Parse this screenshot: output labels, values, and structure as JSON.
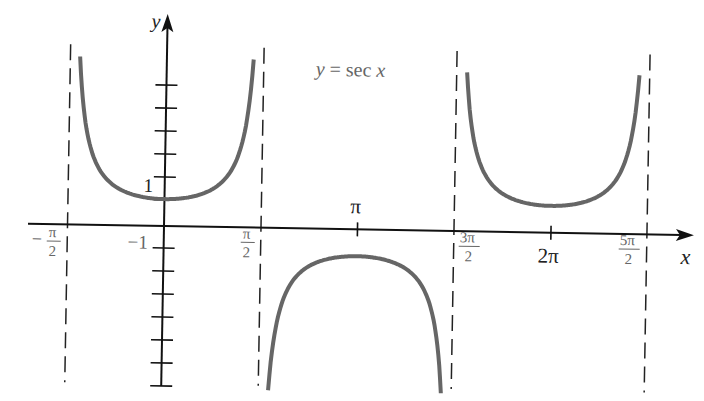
{
  "chart_data": {
    "type": "line",
    "title": "y = sec x",
    "function": "sec x",
    "xlabel": "x",
    "ylabel": "y",
    "x_tick_labels": [
      {
        "value": -1.5708,
        "label": "-π/2",
        "num": "π",
        "den": "2",
        "sign": "−"
      },
      {
        "value": 1.5708,
        "label": "π/2",
        "num": "π",
        "den": "2"
      },
      {
        "value": 3.1416,
        "label": "π"
      },
      {
        "value": 4.7124,
        "label": "3π/2",
        "num": "3π",
        "den": "2"
      },
      {
        "value": 6.2832,
        "label": "2π"
      },
      {
        "value": 7.854,
        "label": "5π/2",
        "num": "5π",
        "den": "2"
      }
    ],
    "y_tick_labels": [
      {
        "value": 1,
        "label": "1"
      },
      {
        "value": -1,
        "label": "−1"
      }
    ],
    "y_ticks_above": 6,
    "y_ticks_below": 7,
    "asymptotes": [
      "-π/2",
      "π/2",
      "3π/2",
      "5π/2"
    ],
    "branches": [
      {
        "x_range": [
          "-π/2",
          "π/2"
        ],
        "extremum": {
          "x": 0,
          "y": 1,
          "type": "min"
        }
      },
      {
        "x_range": [
          "π/2",
          "3π/2"
        ],
        "extremum": {
          "x": "π",
          "y": -1,
          "type": "max"
        }
      },
      {
        "x_range": [
          "3π/2",
          "5π/2"
        ],
        "extremum": {
          "x": "2π",
          "y": 1,
          "type": "min"
        }
      }
    ],
    "sample_points": [
      {
        "x": 0,
        "y": 1
      },
      {
        "x": 0.7854,
        "y": 1.414
      },
      {
        "x": 1.0472,
        "y": 2
      },
      {
        "x": 1.3,
        "y": 3.74
      },
      {
        "x": 3.1416,
        "y": -1
      },
      {
        "x": 2.3562,
        "y": -1.414
      },
      {
        "x": 2.0944,
        "y": -2
      },
      {
        "x": 6.2832,
        "y": 1
      },
      {
        "x": 5.4978,
        "y": 1.414
      },
      {
        "x": 7.0686,
        "y": 1.414
      }
    ],
    "xlim": [
      -1.9,
      8.6
    ],
    "ylim": [
      -7,
      7
    ],
    "grid": false,
    "legend": "none",
    "annotation": "y = sec x"
  },
  "labels": {
    "x_axis": "x",
    "y_axis": "y",
    "annotation_y": "y",
    "annotation_eq": " = sec ",
    "annotation_x": "x",
    "tick_1": "1",
    "tick_neg1": "−1",
    "pi": "π",
    "two_pi": "2π",
    "neg_pi_over_2_sign": "−",
    "neg_pi_over_2_num": "π",
    "neg_pi_over_2_den": "2",
    "pi_over_2_num": "π",
    "pi_over_2_den": "2",
    "three_pi_over_2_num": "3π",
    "three_pi_over_2_den": "2",
    "five_pi_over_2_num": "5π",
    "five_pi_over_2_den": "2"
  },
  "colors": {
    "curve": "#666666",
    "axis": "#111111",
    "asymptote": "#222222",
    "label_dark": "#222222",
    "label_gray": "#666666"
  }
}
